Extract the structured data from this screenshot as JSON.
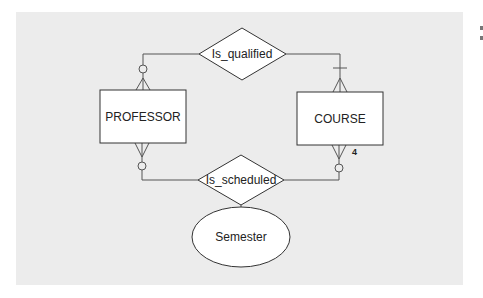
{
  "diagram": {
    "type": "entity-relationship",
    "entities": [
      {
        "id": "professor",
        "label": "PROFESSOR"
      },
      {
        "id": "course",
        "label": "COURSE"
      }
    ],
    "relationships": [
      {
        "id": "is_qualified",
        "label": "Is_qualified",
        "connections": [
          {
            "entity": "professor",
            "cardinality": "zero-or-many"
          },
          {
            "entity": "course",
            "cardinality": "one-or-many"
          }
        ]
      },
      {
        "id": "is_scheduled",
        "label": "Is_scheduled",
        "connections": [
          {
            "entity": "professor",
            "cardinality": "zero-or-many"
          },
          {
            "entity": "course",
            "cardinality": "zero-or-many",
            "annotation": "4"
          }
        ],
        "attributes": [
          "semester"
        ]
      }
    ],
    "attributes": [
      {
        "id": "semester",
        "label": "Semester",
        "of": "is_scheduled"
      }
    ]
  },
  "colors": {
    "background": "#ececec",
    "shape_fill": "#ffffff",
    "stroke": "#333333"
  }
}
